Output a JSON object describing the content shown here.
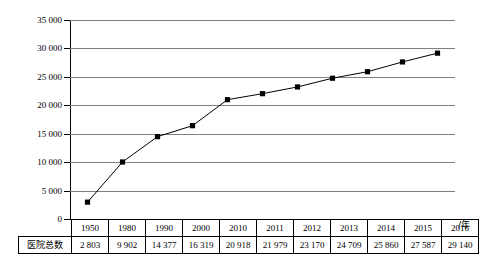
{
  "chart_data": {
    "type": "line",
    "title": "",
    "subtitle": "",
    "xlabel": "/年",
    "ylabel": "",
    "categories": [
      "1950",
      "1980",
      "1990",
      "2000",
      "2010",
      "2011",
      "2012",
      "2013",
      "2014",
      "2015",
      "2016"
    ],
    "x": [
      1950,
      1980,
      1990,
      2000,
      2010,
      2011,
      2012,
      2013,
      2014,
      2015,
      2016
    ],
    "values": [
      2803,
      9902,
      14377,
      16319,
      20918,
      21979,
      23170,
      24709,
      25860,
      27587,
      29140
    ],
    "series": [
      {
        "name": "医院总数",
        "values": [
          2803,
          9902,
          14377,
          16319,
          20918,
          21979,
          23170,
          24709,
          25860,
          27587,
          29140
        ]
      }
    ],
    "value_labels": [
      "2 803",
      "9 902",
      "14 377",
      "16 319",
      "20 918",
      "21 979",
      "23 170",
      "24 709",
      "25 860",
      "27 587",
      "29 140"
    ],
    "ylim": [
      0,
      35000
    ],
    "yticks": [
      0,
      5000,
      10000,
      15000,
      20000,
      25000,
      30000,
      35000
    ],
    "ytick_labels": [
      "0",
      "5 000",
      "10 000",
      "15 000",
      "20 000",
      "25 000",
      "30 000",
      "35 000"
    ],
    "grid": true,
    "legend": false,
    "legend_position": "none",
    "marker": "square",
    "line_color": "#000000",
    "marker_color": "#000000",
    "grid_color": "#808080",
    "axis_color": "#000000",
    "background_color": "#ffffff"
  },
  "table": {
    "row_header_label": "医院总数",
    "year_header_row": [
      "1950",
      "1980",
      "1990",
      "2000",
      "2010",
      "2011",
      "2012",
      "2013",
      "2014",
      "2015",
      "2016"
    ],
    "value_row": [
      "2 803",
      "9 902",
      "14 377",
      "16 319",
      "20 918",
      "21 979",
      "23 170",
      "24 709",
      "25 860",
      "27 587",
      "29 140"
    ]
  },
  "axis": {
    "unit_label": "/年",
    "ytick_labels": [
      "35 000",
      "30 000",
      "25 000",
      "20 000",
      "15 000",
      "10 000",
      "5 000",
      "0"
    ]
  }
}
